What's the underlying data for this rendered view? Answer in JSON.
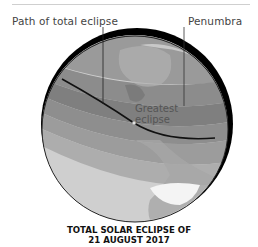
{
  "figure": {
    "labels": {
      "path_of_total_eclipse": "Path of total eclipse",
      "penumbra": "Penumbra",
      "greatest_eclipse_line1": "Greatest",
      "greatest_eclipse_line2": "eclipse"
    },
    "caption": {
      "line1": "TOTAL SOLAR ECLIPSE OF",
      "line2": "21 AUGUST 2017"
    },
    "colors": {
      "shadow_crescent": "#000000",
      "ocean_light": "#cfcfcf",
      "band_dark": "#8a8a8a",
      "band_mid": "#a3a3a3",
      "path_line": "#111111",
      "rule": "#cfcfcf"
    }
  }
}
